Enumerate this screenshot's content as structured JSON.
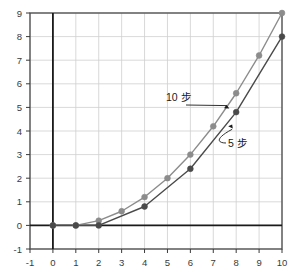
{
  "chart_data": {
    "type": "line",
    "title": "",
    "xlabel": "",
    "ylabel": "",
    "xlim": [
      -1,
      10
    ],
    "ylim": [
      -1,
      9
    ],
    "grid": true,
    "legend_position": "inline-annotations",
    "x_ticks": [
      "-1",
      "0",
      "1",
      "2",
      "3",
      "4",
      "5",
      "6",
      "7",
      "8",
      "9",
      "10"
    ],
    "y_ticks": [
      "-1",
      "0",
      "1",
      "2",
      "3",
      "4",
      "5",
      "6",
      "7",
      "8",
      "9"
    ],
    "series": [
      {
        "name": "10 步",
        "color": "#8c8c8c",
        "marker": "circle",
        "x": [
          0,
          1,
          2,
          3,
          4,
          5,
          6,
          7,
          8,
          9,
          10
        ],
        "values": [
          0,
          0,
          0.2,
          0.6,
          1.2,
          2.0,
          3.0,
          4.2,
          5.6,
          7.2,
          9.0
        ]
      },
      {
        "name": "5 步",
        "color": "#4a4a4a",
        "marker": "circle",
        "x": [
          0,
          1,
          2,
          4,
          6,
          8,
          10
        ],
        "values": [
          0,
          0,
          0,
          0.8,
          2.4,
          4.8,
          8.0
        ]
      }
    ],
    "annotations": [
      {
        "text": "10 步",
        "target_series": "10 步",
        "target_x": 7.7,
        "target_y": 4.95,
        "leader": "straight-arrow"
      },
      {
        "text": "5 步",
        "target_series": "5 步",
        "target_x": 7.65,
        "target_y": 4.2,
        "leader": "curved-arrow"
      }
    ]
  },
  "axes": {
    "grid_color": "#cfcfcf",
    "axis_color": "#1a1a1a",
    "border_color": "#4a4a4a",
    "tick_color": "#3a3a3a"
  }
}
